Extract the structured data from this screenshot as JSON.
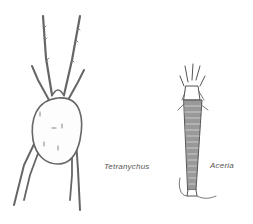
{
  "figure": {
    "specimens": [
      {
        "name": "Tetranychus",
        "label": "Tetranychus"
      },
      {
        "name": "Aceria",
        "label": "Aceria"
      }
    ]
  }
}
